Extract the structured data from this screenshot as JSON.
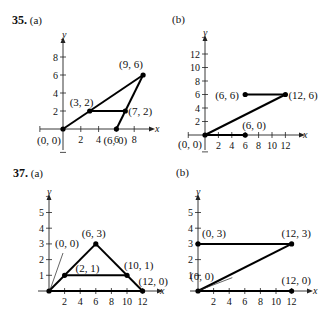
{
  "problems": [
    {
      "number": "35.",
      "part_a": "(a)",
      "part_b": "(b)"
    },
    {
      "number": "37.",
      "part_a": "(a)",
      "part_b": "(b)"
    }
  ],
  "chart_data": [
    {
      "id": "35a",
      "type": "line",
      "title": "35. (a)",
      "xlabel": "x",
      "ylabel": "y",
      "xticks": [
        2,
        4,
        6,
        8
      ],
      "yticks": [
        2,
        4,
        6,
        8
      ],
      "xlim": [
        -2,
        10
      ],
      "ylim": [
        -2,
        10
      ],
      "segments": [
        [
          [
            0,
            0
          ],
          [
            9,
            6
          ]
        ],
        [
          [
            9,
            6
          ],
          [
            6,
            0
          ]
        ],
        [
          [
            3,
            2
          ],
          [
            7,
            2
          ]
        ]
      ],
      "points": [
        {
          "x": 0,
          "y": 0,
          "label": "(0, 0)"
        },
        {
          "x": 3,
          "y": 2,
          "label": "(3, 2)"
        },
        {
          "x": 9,
          "y": 6,
          "label": "(9, 6)"
        },
        {
          "x": 7,
          "y": 2,
          "label": "(7, 2)"
        },
        {
          "x": 6,
          "y": 0,
          "label": "(6, 0)"
        }
      ]
    },
    {
      "id": "35b",
      "type": "line",
      "title": "(b)",
      "xlabel": "x",
      "ylabel": "y",
      "xticks": [
        2,
        4,
        6,
        8,
        10,
        12
      ],
      "yticks": [
        2,
        4,
        6,
        8,
        10,
        12
      ],
      "xlim": [
        -2,
        14
      ],
      "ylim": [
        -2,
        14
      ],
      "segments": [
        [
          [
            0,
            0
          ],
          [
            6,
            0
          ]
        ],
        [
          [
            0,
            0
          ],
          [
            12,
            6
          ]
        ],
        [
          [
            6,
            6
          ],
          [
            12,
            6
          ]
        ]
      ],
      "points": [
        {
          "x": 0,
          "y": 0,
          "label": "(0, 0)"
        },
        {
          "x": 6,
          "y": 0,
          "label": "(6, 0)"
        },
        {
          "x": 6,
          "y": 6,
          "label": "(6, 6)"
        },
        {
          "x": 12,
          "y": 6,
          "label": "(12, 6)"
        }
      ]
    },
    {
      "id": "37a",
      "type": "line",
      "title": "37. (a)",
      "xlabel": "x",
      "ylabel": "y",
      "xticks": [
        2,
        4,
        6,
        8,
        10,
        12
      ],
      "yticks": [
        1,
        2,
        3,
        4,
        5
      ],
      "xlim": [
        0,
        14
      ],
      "ylim": [
        0,
        6
      ],
      "segments": [
        [
          [
            0,
            0
          ],
          [
            6,
            3
          ]
        ],
        [
          [
            6,
            3
          ],
          [
            12,
            0
          ]
        ],
        [
          [
            0,
            0
          ],
          [
            12,
            0
          ]
        ],
        [
          [
            2,
            1
          ],
          [
            10,
            1
          ]
        ]
      ],
      "points": [
        {
          "x": 0,
          "y": 0,
          "label": "(0, 0)"
        },
        {
          "x": 2,
          "y": 1,
          "label": "(2, 1)"
        },
        {
          "x": 6,
          "y": 3,
          "label": "(6, 3)"
        },
        {
          "x": 10,
          "y": 1,
          "label": "(10, 1)"
        },
        {
          "x": 12,
          "y": 0,
          "label": "(12, 0)"
        }
      ]
    },
    {
      "id": "37b",
      "type": "line",
      "title": "(b)",
      "xlabel": "x",
      "ylabel": "y",
      "xticks": [
        2,
        4,
        6,
        8,
        10,
        12
      ],
      "yticks": [
        1,
        2,
        3,
        4,
        5
      ],
      "xlim": [
        0,
        14
      ],
      "ylim": [
        0,
        6
      ],
      "segments": [
        [
          [
            0,
            0
          ],
          [
            12,
            0
          ]
        ],
        [
          [
            0,
            0
          ],
          [
            12,
            3
          ]
        ],
        [
          [
            0,
            3
          ],
          [
            12,
            3
          ]
        ]
      ],
      "points": [
        {
          "x": 0,
          "y": 0,
          "label": "(0, 0)"
        },
        {
          "x": 0,
          "y": 3,
          "label": "(0, 3)"
        },
        {
          "x": 12,
          "y": 3,
          "label": "(12, 3)"
        },
        {
          "x": 12,
          "y": 0,
          "label": "(12, 0)"
        }
      ]
    }
  ]
}
